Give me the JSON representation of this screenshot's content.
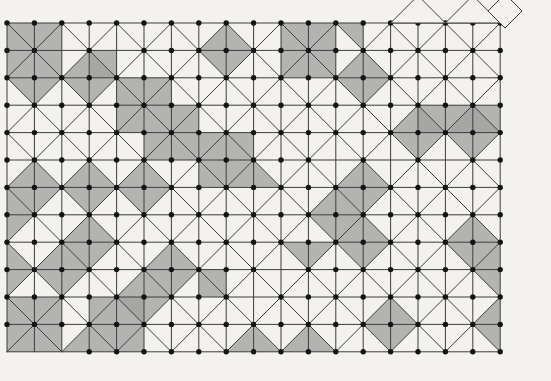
{
  "figure": {
    "kind": "lattice-diagram",
    "background": "#f3f2ee",
    "canvas": {
      "width": 551,
      "height": 381
    }
  },
  "lattice": {
    "origin_x": 7,
    "origin_y": 23,
    "spacing": 27.4,
    "cols": 18,
    "rows": 12
  },
  "style": {
    "line_color": "#3c3c3c",
    "line_width": 1,
    "shade_fill": "#a3a3a1",
    "shade_opacity": 0.8,
    "dot_color": "#141414",
    "dot_radius": 2.7
  },
  "shaded": {
    "diamonds": [
      [
        3,
        2
      ],
      [
        8,
        1
      ],
      [
        13,
        2
      ],
      [
        15,
        4
      ],
      [
        17,
        4
      ],
      [
        13,
        6
      ],
      [
        12,
        7
      ],
      [
        1,
        6
      ],
      [
        3,
        6
      ],
      [
        5,
        6
      ],
      [
        3,
        8
      ],
      [
        2,
        9
      ],
      [
        5,
        10
      ],
      [
        6,
        9
      ],
      [
        13,
        8
      ],
      [
        17,
        8
      ],
      [
        14,
        11
      ]
    ],
    "cells": [
      [
        0,
        0
      ],
      [
        1,
        0
      ],
      [
        0,
        1
      ],
      [
        1,
        1
      ],
      [
        3,
        1
      ],
      [
        4,
        2
      ],
      [
        5,
        2
      ],
      [
        4,
        3
      ],
      [
        5,
        3
      ],
      [
        6,
        3
      ],
      [
        5,
        4
      ],
      [
        6,
        4
      ],
      [
        7,
        4
      ],
      [
        8,
        4
      ],
      [
        7,
        5
      ],
      [
        8,
        5
      ],
      [
        10,
        0
      ],
      [
        11,
        0
      ],
      [
        10,
        1
      ],
      [
        11,
        1
      ],
      [
        15,
        3
      ],
      [
        16,
        3
      ],
      [
        17,
        3
      ],
      [
        7,
        9
      ],
      [
        0,
        10
      ],
      [
        1,
        10
      ],
      [
        0,
        11
      ],
      [
        1,
        11
      ],
      [
        3,
        10
      ],
      [
        4,
        10
      ],
      [
        3,
        11
      ],
      [
        4,
        11
      ]
    ],
    "tris": [
      [
        0,
        2,
        "NE"
      ],
      [
        1,
        2,
        "NW"
      ],
      [
        12,
        0,
        "NE"
      ],
      [
        9,
        5,
        "SW"
      ],
      [
        0,
        6,
        "SW"
      ],
      [
        0,
        7,
        "NW"
      ],
      [
        0,
        8,
        "SW"
      ],
      [
        0,
        9,
        "NW"
      ],
      [
        2,
        11,
        "SE"
      ],
      [
        8,
        11,
        "SE"
      ],
      [
        9,
        11,
        "SW"
      ],
      [
        10,
        11,
        "SE"
      ],
      [
        11,
        11,
        "SW"
      ],
      [
        10,
        8,
        "NE"
      ],
      [
        11,
        8,
        "NW"
      ],
      [
        17,
        8,
        "SE"
      ],
      [
        17,
        9,
        "NE"
      ],
      [
        17,
        10,
        "SE"
      ],
      [
        17,
        11,
        "NE"
      ]
    ]
  },
  "extras": {
    "top_peaks": [
      [
        15,
        0
      ],
      [
        17,
        0
      ]
    ],
    "corner_diamond": {
      "cx": 505,
      "cy": 11,
      "r": 17
    }
  },
  "dots": {
    "at_all_vertices": true,
    "missing": [
      [
        2,
        1
      ],
      [
        4,
        1
      ],
      [
        12,
        5
      ],
      [
        14,
        5
      ],
      [
        16,
        5
      ],
      [
        10,
        9
      ],
      [
        9,
        10
      ],
      [
        0,
        12
      ],
      [
        1,
        12
      ],
      [
        2,
        12
      ]
    ]
  }
}
